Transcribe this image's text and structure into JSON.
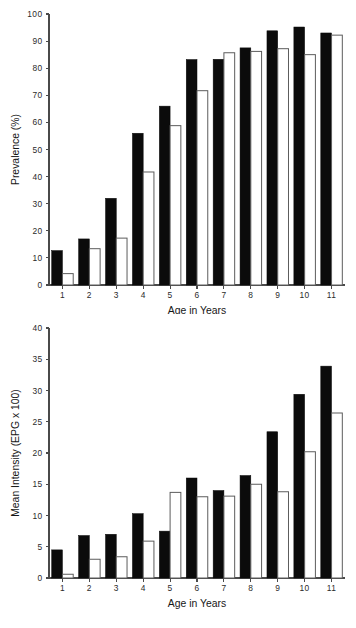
{
  "figure": {
    "background": "#ffffff",
    "ink_color": "#0b0b0b",
    "axis_color": "#4a4a4a",
    "open_bar_stroke": "#5c5c5c"
  },
  "chart_data": [
    {
      "id": "prevalence",
      "type": "bar",
      "title": "",
      "xlabel": "Age in Years",
      "ylabel": "Prevalence (%)",
      "categories": [
        "1",
        "2",
        "3",
        "4",
        "5",
        "6",
        "7",
        "8",
        "9",
        "10",
        "11"
      ],
      "xlim": [
        0,
        11
      ],
      "ylim": [
        0,
        100
      ],
      "yticks": [
        0,
        10,
        20,
        30,
        40,
        50,
        60,
        70,
        80,
        90,
        100
      ],
      "ytick_labels": [
        "0",
        "10",
        "20",
        "30",
        "40",
        "50",
        "60",
        "70",
        "80",
        "90",
        "100"
      ],
      "grid": false,
      "legend": "none",
      "series": [
        {
          "name": "solid",
          "style": "filled-black",
          "values": [
            12.7,
            17.0,
            32.0,
            56.0,
            66.0,
            83.2,
            83.3,
            87.5,
            93.8,
            95.2,
            93.0
          ]
        },
        {
          "name": "open",
          "style": "open-white",
          "values": [
            4.2,
            13.4,
            17.3,
            41.7,
            58.8,
            71.7,
            85.7,
            86.2,
            87.2,
            85.0,
            92.2
          ]
        }
      ]
    },
    {
      "id": "mean-intensity",
      "type": "bar",
      "title": "",
      "xlabel": "Age in Years",
      "ylabel": "Mean Intensity (EPG x 100)",
      "categories": [
        "1",
        "2",
        "3",
        "4",
        "5",
        "6",
        "7",
        "8",
        "9",
        "10",
        "11"
      ],
      "xlim": [
        0,
        11
      ],
      "ylim": [
        0,
        40
      ],
      "yticks": [
        0,
        5,
        10,
        15,
        20,
        25,
        30,
        35,
        40
      ],
      "ytick_labels": [
        "0",
        "5",
        "10",
        "15",
        "20",
        "25",
        "30",
        "35",
        "40"
      ],
      "grid": false,
      "legend": "none",
      "series": [
        {
          "name": "solid",
          "style": "filled-black",
          "values": [
            4.5,
            6.8,
            7.0,
            10.3,
            7.5,
            16.0,
            14.0,
            16.4,
            23.4,
            29.4,
            33.9
          ]
        },
        {
          "name": "open",
          "style": "open-white",
          "values": [
            0.6,
            3.0,
            3.4,
            5.9,
            13.7,
            13.0,
            13.1,
            15.0,
            13.8,
            20.2,
            26.4
          ]
        }
      ]
    }
  ]
}
